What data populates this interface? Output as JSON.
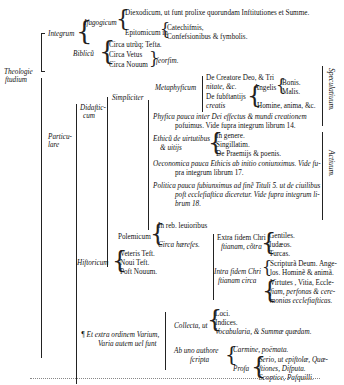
{
  "root": {
    "label_1": "Theologie",
    "label_2": "ftudium"
  },
  "integrum": {
    "label": "Integrum",
    "isagogicum": {
      "label": "Ifagogicum",
      "items": [
        "Diexodicum, ut funt prolixe quorundam Inftitutiones et Summe.",
        "Epitomicum in"
      ],
      "epitomicum_sub": [
        "Catechifmis,",
        "Confefsionibus & fymbolis."
      ]
    },
    "biblicum": {
      "label": "Biblicũ",
      "items": [
        "Circa utrũq; Tefta.",
        "Circa Vetus",
        "Circa Nouum"
      ],
      "seorsim": "feorfim."
    }
  },
  "particulare": {
    "label_1": "Particu-",
    "label_2": "lare",
    "didacticum": {
      "label_1": "Didaftic-",
      "label_2": "cum",
      "simpliciter": {
        "label": "Simpliciter",
        "metaphysicum": {
          "label": "Metaphyficum",
          "de_creatore_1": "De Creatore Deo, & Tri",
          "de_creatore_2": "nitate, &c.",
          "de_substantiis_1": "De fubftantijs",
          "de_substantiis_2": "creatis",
          "angelis": "Angelis",
          "angelis_sub": [
            "Bonis.",
            "Malis."
          ],
          "homine": "Homine, anima, &c."
        },
        "physica_1": "Phyfica pauca inter Dei effectus & mundi creationem",
        "physica_2": "pofuimus. Vide fupra integrum librum 14.",
        "ethica": {
          "label_1": "Ethicũ de uirtutibus",
          "label_2": "& uitijs",
          "items": [
            "In genere.",
            "Singillatim.",
            "De Praemijs & poenis."
          ]
        },
        "oeconomica_1": "Oeconomica pauca Ethicis ab initio coniunximus. Vide fu-",
        "oeconomica_2": "pra integrum librum 17.",
        "politica_1": "Politica pauca fubiunximus ad finẽ Tituli 5. ut de ciuilibus",
        "politica_2": "poft ecclefiaftica diceretur. Vide fupra integrum li-",
        "politica_3": "brum 18.",
        "side_labels": [
          "Speculatiuum.",
          "Actiuum."
        ]
      },
      "polemicum": {
        "label": "Polemicum",
        "items": [
          "In reb. leuioribus",
          "Circa hærefes."
        ],
        "extra": {
          "label_1": "Extra fidem Chri",
          "label_2": "ftianam, cõtra",
          "items": [
            "Gentiles.",
            "Iudæos.",
            "Turcas."
          ]
        },
        "intra": {
          "label_1": "Intra fidem Chri",
          "label_2": "ftianam circa",
          "items_1": [
            "Scripturã Deum. Ange-",
            "los. Hominẽ & animã."
          ],
          "items_2": [
            "Virtutes , Vitia, Eccle-",
            "fiam, perfonas & cere-",
            "monias ecclefiafticas."
          ]
        }
      }
    },
    "historicum": {
      "label": "Hiftoricum",
      "items": [
        "Veteris Teft.",
        "Noui Teft.",
        "Poft Nouum."
      ]
    },
    "varium": {
      "label_1": "¶ Et extra ordinem Varium,",
      "label_2": "Varia autem uel funt",
      "collecta": {
        "label": "Collecta, ut",
        "items": [
          "Loci.",
          "Indices.",
          "Vocabularia, & Summæ quædam."
        ]
      },
      "ab_uno": {
        "label_1": "Ab uno authore",
        "label_2": "fcripta",
        "carmine": "Carmine, poëmata.",
        "prosa": "Profa",
        "prosa_items": [
          "Serio, ut epiftolæ, Quæ-",
          "ftiones, Difputa.",
          "Scoptice, Pafquilli."
        ]
      }
    }
  }
}
